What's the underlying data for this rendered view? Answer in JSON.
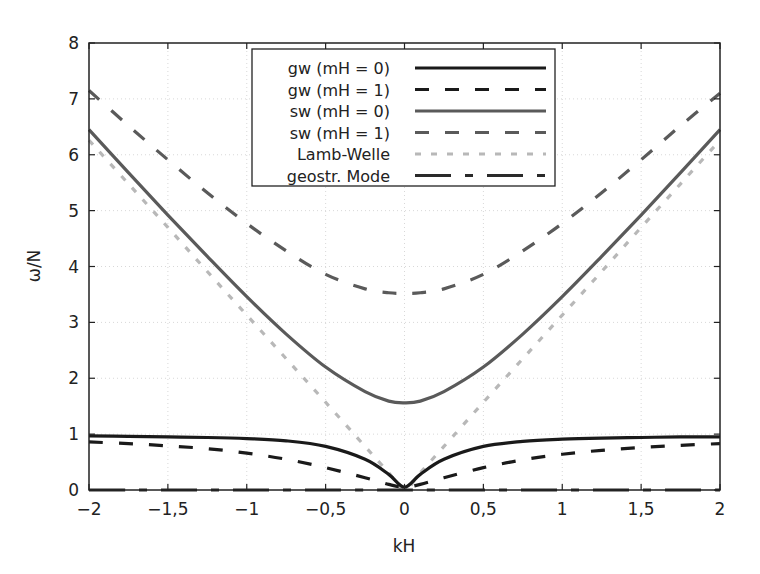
{
  "chart_data": {
    "type": "line",
    "title": "",
    "xlabel": "kH",
    "ylabel": "ω/N",
    "xlim": [
      -2,
      2
    ],
    "ylim": [
      0,
      8
    ],
    "grid": true,
    "legend_position": "upper center",
    "x_ticks": [
      -2,
      -1.5,
      -1,
      -0.5,
      0,
      0.5,
      1,
      1.5,
      2
    ],
    "x_tick_labels": [
      "−2",
      "−1,5",
      "−1",
      "−0,5",
      "0",
      "0,5",
      "1",
      "1,5",
      "2"
    ],
    "y_ticks": [
      0,
      1,
      2,
      3,
      4,
      5,
      6,
      7,
      8
    ],
    "y_tick_labels": [
      "0",
      "1",
      "2",
      "3",
      "4",
      "5",
      "6",
      "7",
      "8"
    ],
    "x": [
      -2,
      -1.75,
      -1.5,
      -1.25,
      -1,
      -0.75,
      -0.5,
      -0.25,
      -0.1,
      0,
      0.1,
      0.25,
      0.5,
      0.75,
      1,
      1.25,
      1.5,
      1.75,
      2
    ],
    "series": [
      {
        "name": "gw (mH = 0)",
        "style": "solid",
        "color": "#1a1a1a",
        "width": 3.2,
        "values": [
          0.97,
          0.96,
          0.95,
          0.94,
          0.92,
          0.88,
          0.78,
          0.55,
          0.28,
          0.05,
          0.28,
          0.55,
          0.78,
          0.87,
          0.91,
          0.93,
          0.94,
          0.95,
          0.95
        ]
      },
      {
        "name": "gw (mH = 1)",
        "style": "dashed",
        "color": "#1a1a1a",
        "width": 3.2,
        "values": [
          0.86,
          0.83,
          0.79,
          0.74,
          0.66,
          0.55,
          0.4,
          0.22,
          0.1,
          0.05,
          0.1,
          0.22,
          0.4,
          0.54,
          0.64,
          0.71,
          0.76,
          0.8,
          0.83
        ]
      },
      {
        "name": "sw (mH = 0)",
        "style": "solid",
        "color": "#5a5a5a",
        "width": 3.2,
        "values": [
          6.45,
          5.68,
          4.92,
          4.18,
          3.46,
          2.79,
          2.2,
          1.76,
          1.59,
          1.56,
          1.59,
          1.76,
          2.2,
          2.79,
          3.46,
          4.18,
          4.92,
          5.68,
          6.45
        ]
      },
      {
        "name": "sw (mH = 1)",
        "style": "dashed",
        "color": "#5a5a5a",
        "width": 3.2,
        "values": [
          7.15,
          6.52,
          5.91,
          5.32,
          4.77,
          4.28,
          3.86,
          3.6,
          3.53,
          3.52,
          3.53,
          3.6,
          3.86,
          4.28,
          4.77,
          5.32,
          5.91,
          6.52,
          7.1
        ]
      },
      {
        "name": "Lamb-Welle",
        "style": "dotted",
        "color": "#b8b8b8",
        "width": 3.2,
        "values": [
          6.26,
          5.48,
          4.7,
          3.91,
          3.13,
          2.35,
          1.57,
          0.78,
          0.31,
          0.0,
          0.31,
          0.78,
          1.57,
          2.35,
          3.13,
          3.91,
          4.7,
          5.48,
          6.26
        ]
      },
      {
        "name": "geostr. Mode",
        "style": "dashdot",
        "color": "#2a2a2a",
        "width": 3.2,
        "values": [
          0,
          0,
          0,
          0,
          0,
          0,
          0,
          0,
          0,
          0,
          0,
          0,
          0,
          0,
          0,
          0,
          0,
          0,
          0
        ]
      }
    ]
  }
}
